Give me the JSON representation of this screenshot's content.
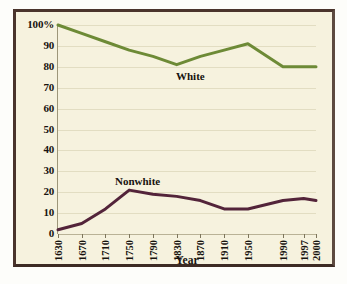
{
  "chart_data": {
    "type": "line",
    "title": "",
    "xlabel": "Year",
    "ylabel": "",
    "grid": "horizontal",
    "legend_position": "inline-annotation",
    "categories": [
      "1630",
      "1670",
      "1710",
      "1750",
      "1790",
      "1830",
      "1870",
      "1910",
      "1950",
      "1990",
      "1997",
      "2000"
    ],
    "ylim": [
      0,
      100
    ],
    "yticks": [
      "0",
      "10",
      "20",
      "30",
      "40",
      "50",
      "60",
      "70",
      "80",
      "90",
      "100%"
    ],
    "ytick_values": [
      0,
      10,
      20,
      30,
      40,
      50,
      60,
      70,
      80,
      90,
      100
    ],
    "series": [
      {
        "name": "White",
        "color": "#6d8a36",
        "values": [
          100,
          96,
          92,
          88,
          85,
          81,
          85,
          88,
          91,
          80,
          80,
          80
        ]
      },
      {
        "name": "Nonwhite",
        "color": "#53243a",
        "values": [
          2,
          5,
          12,
          21,
          19,
          18,
          16,
          12,
          12,
          16,
          17,
          16
        ]
      }
    ],
    "annotations": [
      {
        "text": "White",
        "series": "White"
      },
      {
        "text": "Nonwhite",
        "series": "Nonwhite"
      }
    ]
  },
  "axes": {
    "x_title": "Year",
    "y_tick_labels": [
      "100%",
      "90",
      "80",
      "70",
      "60",
      "50",
      "40",
      "30",
      "20",
      "10",
      "0"
    ],
    "x_tick_labels": [
      "1630",
      "1670",
      "1710",
      "1750",
      "1790",
      "1830",
      "1870",
      "1910",
      "1950",
      "1990",
      "1997",
      "2000"
    ]
  },
  "series_labels": {
    "white": "White",
    "nonwhite": "Nonwhite"
  },
  "colors": {
    "white_line": "#6d8a36",
    "nonwhite_line": "#53243a",
    "background": "#f6f2de",
    "frame": "#4a342c",
    "gridline": "#e2ddc2"
  }
}
